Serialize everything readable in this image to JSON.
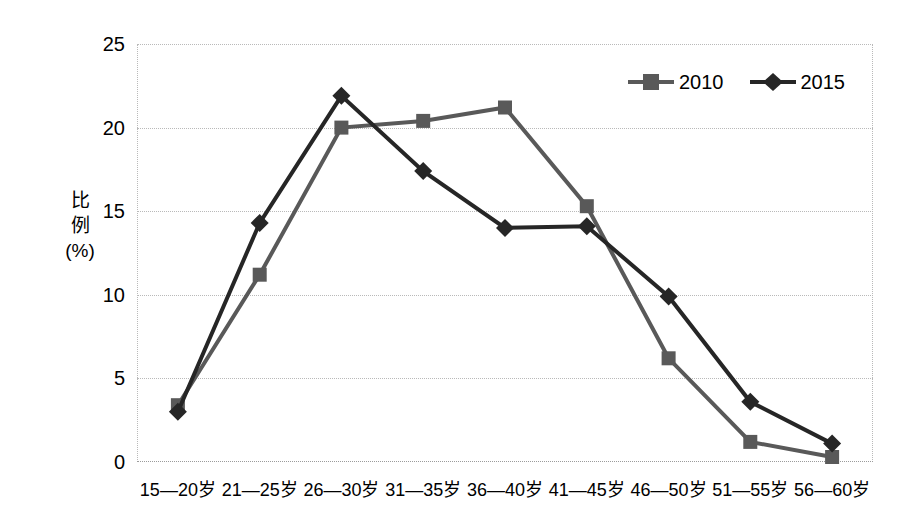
{
  "chart_data": {
    "type": "line",
    "title": "",
    "subtitle": "",
    "xlabel": "",
    "ylabel": "比例\n(%)",
    "ylabel_lines": [
      "比",
      "例",
      "(%)"
    ],
    "categories": [
      "15—20岁",
      "21—25岁",
      "26—30岁",
      "31—35岁",
      "36—40岁",
      "41—45岁",
      "46—50岁",
      "51—55岁",
      "56—60岁"
    ],
    "series": [
      {
        "name": "2010",
        "marker": "square",
        "color": "#595959",
        "values": [
          3.4,
          11.2,
          20.0,
          20.4,
          21.2,
          15.3,
          6.2,
          1.2,
          0.3
        ]
      },
      {
        "name": "2015",
        "marker": "diamond",
        "color": "#262626",
        "values": [
          3.0,
          14.3,
          21.9,
          17.4,
          14.0,
          14.1,
          9.9,
          3.6,
          1.1
        ]
      }
    ],
    "ylim": [
      0,
      25
    ],
    "ytick_values": [
      0,
      5,
      10,
      15,
      20,
      25
    ],
    "ytick_labels": [
      "0",
      "5",
      "10",
      "15",
      "20",
      "25"
    ],
    "grid": true,
    "grid_style": "dotted",
    "grid_color": "#b9b9b9",
    "legend_position": "top-right",
    "background": "#ffffff"
  },
  "legend": {
    "entries": [
      {
        "label": "2010"
      },
      {
        "label": "2015"
      }
    ]
  }
}
